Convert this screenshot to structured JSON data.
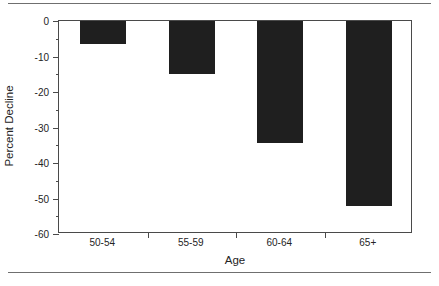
{
  "chart_data": {
    "type": "bar",
    "title": "",
    "xlabel": "Age",
    "ylabel": "Percent Decline",
    "categories": [
      "50-54",
      "55-59",
      "60-64",
      "65+"
    ],
    "values": [
      -6.5,
      -15,
      -34.5,
      -52
    ],
    "ylim": [
      -60,
      0
    ],
    "ytick_labels": [
      "0",
      "-10",
      "-20",
      "-30",
      "-40",
      "-50",
      "-60"
    ],
    "ytick_values": [
      0,
      -10,
      -20,
      -30,
      -40,
      -50,
      -60
    ],
    "yminor_values": [
      -5,
      -15,
      -25,
      -35,
      -45,
      -55
    ],
    "grid": false,
    "legend": null,
    "bar_color": "#1f1f1f",
    "axis_color": "#4a4a4a"
  }
}
